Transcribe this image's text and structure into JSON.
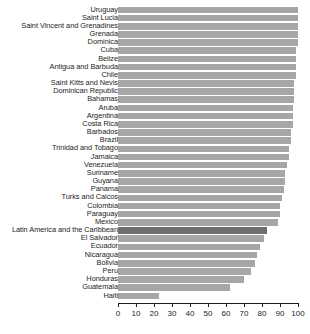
{
  "chart_data": {
    "type": "bar",
    "orientation": "horizontal",
    "title": "",
    "subtitle": "",
    "xlabel": "",
    "ylabel": "",
    "xlim": [
      0,
      100
    ],
    "xticks": [
      0,
      10,
      20,
      30,
      40,
      50,
      60,
      70,
      80,
      90,
      100
    ],
    "grid": false,
    "legend": "none",
    "bar_color": "#a6a6a6",
    "highlight_color": "#6e6e6e",
    "highlight_category": "Latin America and the Caribbean",
    "categories": [
      "Uruguay",
      "Saint Lucia",
      "Saint Vincent and Grenadines",
      "Grenada",
      "Dominica",
      "Cuba",
      "Belize",
      "Antigua and Barbuda",
      "Chile",
      "Saint Kitts and Nevis",
      "Dominican Republic",
      "Bahamas",
      "Aruba",
      "Argentina",
      "Costa Rica",
      "Barbados",
      "Brazil",
      "Trinidad and Tobago",
      "Jamaica",
      "Venezuela",
      "Suriname",
      "Guyana",
      "Panama",
      "Turks and Caicos",
      "Colombia",
      "Paraguay",
      "Mexico",
      "Latin America and the Caribbean",
      "El Salvador",
      "Ecuador",
      "Nicaragua",
      "Bolivia",
      "Peru",
      "Honduras",
      "Guatemala",
      "Haiti"
    ],
    "values": [
      100,
      100,
      100,
      100,
      100,
      99,
      99,
      99,
      99,
      98,
      98,
      98,
      97,
      97,
      97,
      96,
      96,
      95,
      95,
      94,
      93,
      93,
      92,
      91,
      90,
      90,
      89,
      83,
      81,
      79,
      77,
      76,
      74,
      70,
      62,
      23
    ]
  }
}
